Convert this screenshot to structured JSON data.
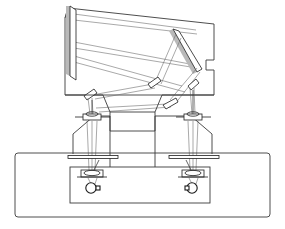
{
  "figure": {
    "title": "Dual-channel folded optical system schematic",
    "type": "technical-line-drawing",
    "background_color": "#ffffff",
    "line_color": "#3a3a3a",
    "ray_color": "#6f6f6f",
    "mirror_fill": "#ffffff",
    "mirror_shade": "#b9b9b9",
    "canvas": {
      "width": 285,
      "height": 229
    }
  },
  "components": {
    "upper_housing": {
      "name": "tilted upper optical housing",
      "outline_points": "68,8 214,24 214,60 206,60 206,70 214,70 214,95 65,95 65,18",
      "tilt_note": "quadrilateral tilted, top edge rising left to right"
    },
    "primary_mirror": {
      "name": "primary tilted mirror",
      "face_points": "70,6 76,10 76,80 70,76",
      "shade_points": "66,6 70,6 70,76 66,74"
    },
    "fold_mirror_large": {
      "name": "large diagonal fold mirror",
      "face_points": "173,29 179,31 202,69 197,72",
      "shade_points": "169,31 173,29 197,72 193,74"
    },
    "fold_mirror_upper_left": {
      "name": "upper-left small fold mirror",
      "face_points": "148,84 158,77 161,81 151,88",
      "shade_points": "149,87 151,88 161,81 159,78"
    },
    "fold_mirror_lower": {
      "name": "lower small fold mirror",
      "face_points": "163,105 176,98 178,102 166,109",
      "shade_points": "164,108 166,109 178,102 176,99"
    },
    "fold_mirror_right_channel": {
      "name": "right channel fold mirror",
      "face_points": "188,86 196,79 199,83 191,90"
    },
    "fold_mirror_left_channel": {
      "name": "left channel fold mirror",
      "face_points": "84,96 94,89 97,93 87,100"
    },
    "mid_housing": {
      "name": "middle trapezoidal housing",
      "outline_points": "65,95 103,95 110,112 155,112 162,95 214,95 214,118 162,118"
    },
    "lower_housing_outer": {
      "name": "outer instrument frame",
      "x": 15,
      "y": 153,
      "width": 255,
      "height": 64,
      "corner_radius": 3
    },
    "lower_housing_inner": {
      "name": "inner detector enclosure",
      "x": 70,
      "y": 167,
      "width": 140,
      "height": 36
    },
    "channel_supports": {
      "name": "channel support brackets",
      "left_points": "75,133 95,118 128,118 128,153",
      "right_points": "210,133 190,118 143,118 143,153"
    }
  },
  "optical_channels": [
    {
      "id": "left-channel",
      "name": "left optical channel",
      "collimator": {
        "cx": 92,
        "cy": 118,
        "rx": 10,
        "ry": 3.5
      },
      "aperture_bar": {
        "x1": 68,
        "y1": 157,
        "x2": 118,
        "y2": 157
      },
      "objective_lens": {
        "cx": 92,
        "cy": 173,
        "rx": 10,
        "ry": 4
      },
      "detector": {
        "cx": 91,
        "cy": 188,
        "r": 5.2
      },
      "beam_points": "85,122 99,122 96,170 88,170"
    },
    {
      "id": "right-channel",
      "name": "right optical channel",
      "collimator": {
        "cx": 193,
        "cy": 118,
        "rx": 10,
        "ry": 3.5
      },
      "aperture_bar": {
        "x1": 169,
        "y1": 157,
        "x2": 219,
        "y2": 157
      },
      "objective_lens": {
        "cx": 193,
        "cy": 173,
        "rx": 10,
        "ry": 4
      },
      "detector": {
        "cx": 192,
        "cy": 188,
        "r": 5.2
      },
      "beam_points": "186,122 200,122 197,170 189,170"
    }
  ],
  "ray_paths": {
    "name": "traced light rays",
    "upper_bundle": [
      "74,14 196,30",
      "74,20 197,34",
      "74,42 195,65",
      "74,48 197,68",
      "74,56 182,86",
      "74,62 185,92"
    ],
    "fold_bundle": [
      "176,34 156,80",
      "181,38 161,84",
      "197,68 170,100",
      "200,72 175,104",
      "153,84 92,95",
      "155,88 95,99",
      "168,104 96,108",
      "171,107 99,112"
    ],
    "channel_feed": [
      "190,86 192,114",
      "194,86 195,114",
      "88,98 90,114",
      "92,98 93,114"
    ]
  },
  "labels": {
    "none_visible": "This technical drawing contains no visible text labels"
  }
}
